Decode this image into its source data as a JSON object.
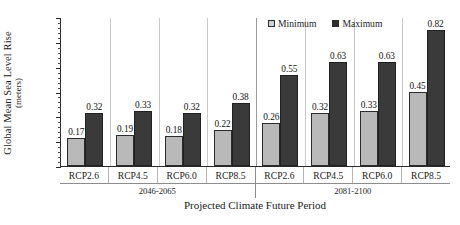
{
  "chart_data": {
    "type": "bar",
    "title": "",
    "xlabel": "Projected Climate Future Period",
    "ylabel": "Global Mean Sea Level Rise (meters)",
    "ylabel_line1": "Global Mean Sea Level Rise",
    "ylabel_line2": "(meters)",
    "ylim": [
      0.0,
      0.9
    ],
    "yticks": [
      "0.00",
      "0.15",
      "0.30",
      "0.45",
      "0.60",
      "0.75",
      "0.90"
    ],
    "ytick_values": [
      0.0,
      0.15,
      0.3,
      0.45,
      0.6,
      0.75,
      0.9
    ],
    "minor_tick_step": 0.03,
    "grid": false,
    "legend_position": "top-right",
    "categories": [
      "RCP2.6",
      "RCP4.5",
      "RCP6.0",
      "RCP8.5",
      "RCP2.6",
      "RCP4.5",
      "RCP6.0",
      "RCP8.5"
    ],
    "groups": [
      {
        "label": "2046-2065",
        "categories": [
          "RCP2.6",
          "RCP4.5",
          "RCP6.0",
          "RCP8.5"
        ]
      },
      {
        "label": "2081-2100",
        "categories": [
          "RCP2.6",
          "RCP4.5",
          "RCP6.0",
          "RCP8.5"
        ]
      }
    ],
    "series": [
      {
        "name": "Minimum",
        "color": "#b9b9b9",
        "values": [
          0.17,
          0.19,
          0.18,
          0.22,
          0.26,
          0.32,
          0.33,
          0.45
        ]
      },
      {
        "name": "Maximum",
        "color": "#3a3a3a",
        "values": [
          0.32,
          0.33,
          0.32,
          0.38,
          0.55,
          0.63,
          0.63,
          0.82
        ]
      }
    ],
    "data_labels": {
      "Minimum": [
        "0.17",
        "0.19",
        "0.18",
        "0.22",
        "0.26",
        "0.32",
        "0.33",
        "0.45"
      ],
      "Maximum": [
        "0.32",
        "0.33",
        "0.32",
        "0.38",
        "0.55",
        "0.63",
        "0.63",
        "0.82"
      ]
    }
  },
  "legend": {
    "items": [
      {
        "label": "Minimum",
        "swatch": "minimum-swatch"
      },
      {
        "label": "Maximum",
        "swatch": "maximum-swatch"
      }
    ]
  },
  "axes": {
    "y_title_line1": "Global Mean Sea Level Rise",
    "y_title_line2": "(meters)",
    "x_title": "Projected Climate Future Period"
  }
}
